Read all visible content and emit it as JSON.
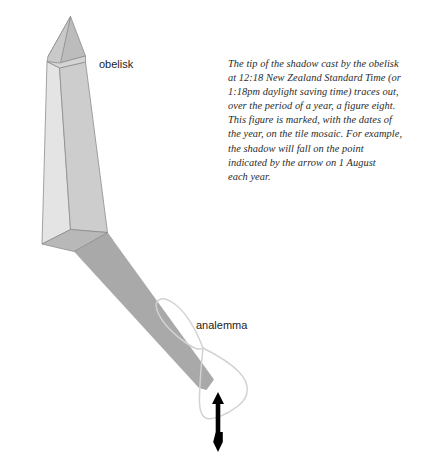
{
  "figure": {
    "background_color": "#ffffff",
    "labels": {
      "obelisk": "obelisk",
      "analemma": "analemma"
    },
    "caption_lines": [
      "The tip of the shadow cast by the obelisk",
      "at 12:18 New Zealand Standard Time (or",
      "1:18pm daylight saving time) traces out,",
      "over the period of a year, a figure eight.",
      "This figure is marked, with the dates of",
      "the year, on the tile mosaic. For example,",
      "the shadow will fall on the point",
      "indicated by the arrow on 1 August",
      "each year."
    ],
    "caption_text": "The tip of the shadow cast by the obelisk at 12:18 New Zealand Standard Time (or 1:18pm daylight saving time) traces out, over the period of a year, a figure eight. This figure is marked, with the dates of the year, on the tile mosaic. For example, the shadow will fall on the point indicated by the arrow on 1 August each year.",
    "colors": {
      "obelisk_left_face": "#e4e4e4",
      "obelisk_right_face": "#c9c9c9",
      "obelisk_pyramid_left": "#d8d8d8",
      "obelisk_pyramid_right": "#b9b9b9",
      "obelisk_outline": "#8d8d8d",
      "shadow": "#a9a9a9",
      "analemma_line": "#d2d2d2",
      "arrow": "#000000",
      "caption_text": "#2b2b2b",
      "label_text": "#1d1d1d"
    },
    "annotation_arrow": {
      "name": "date-marker-arrow",
      "direction": "up",
      "meaning": "1 August"
    }
  }
}
